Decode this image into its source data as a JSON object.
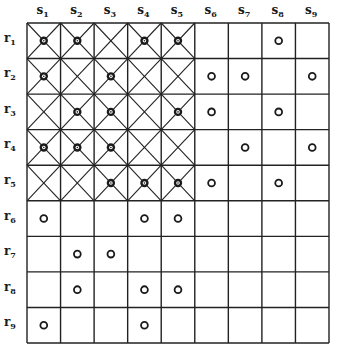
{
  "diagram": {
    "columns": [
      "s1",
      "s2",
      "s3",
      "s4",
      "s5",
      "s6",
      "s7",
      "s8",
      "s9"
    ],
    "rows": [
      "r1",
      "r2",
      "r3",
      "r4",
      "r5",
      "r6",
      "r7",
      "r8",
      "r9"
    ],
    "crossed_region": {
      "rows": [
        1,
        5
      ],
      "cols": [
        1,
        5
      ]
    },
    "marks": {
      "filled": [
        [
          1,
          1
        ],
        [
          1,
          2
        ],
        [
          1,
          4
        ],
        [
          1,
          5
        ],
        [
          2,
          1
        ],
        [
          2,
          3
        ],
        [
          3,
          2
        ],
        [
          3,
          3
        ],
        [
          3,
          5
        ],
        [
          4,
          1
        ],
        [
          4,
          2
        ],
        [
          4,
          3
        ],
        [
          5,
          3
        ],
        [
          5,
          4
        ],
        [
          5,
          5
        ]
      ],
      "open": [
        [
          1,
          8
        ],
        [
          2,
          6
        ],
        [
          2,
          7
        ],
        [
          2,
          9
        ],
        [
          3,
          6
        ],
        [
          3,
          8
        ],
        [
          4,
          7
        ],
        [
          4,
          9
        ],
        [
          5,
          6
        ],
        [
          5,
          8
        ],
        [
          6,
          1
        ],
        [
          6,
          4
        ],
        [
          6,
          5
        ],
        [
          7,
          2
        ],
        [
          7,
          3
        ],
        [
          8,
          2
        ],
        [
          8,
          4
        ],
        [
          8,
          5
        ],
        [
          9,
          1
        ],
        [
          9,
          4
        ]
      ]
    },
    "colors": {
      "line": "#222222",
      "mark": "#1a1a1a",
      "background": "#ffffff"
    }
  }
}
